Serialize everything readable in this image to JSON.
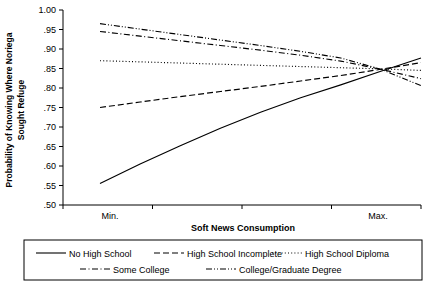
{
  "chart_data": {
    "type": "line",
    "title": "",
    "xlabel": "Soft News Consumption",
    "ylabel": "Probability of Knowing Where Noriega Sought Refuge",
    "ylabel_line1": "Probability of Knowing Where Noriega",
    "ylabel_line2": "Sought Refuge",
    "ylim": [
      0.5,
      1.0
    ],
    "ytick_labels": [
      "1.00",
      ".95",
      ".90",
      ".85",
      ".80",
      ".75",
      ".70",
      ".65",
      ".60",
      ".55",
      ".50"
    ],
    "ytick_values": [
      1.0,
      0.95,
      0.9,
      0.85,
      0.8,
      0.75,
      0.7,
      0.65,
      0.6,
      0.55,
      0.5
    ],
    "xtick_labels": [
      "Min.",
      "Max."
    ],
    "xlim": [
      0,
      1
    ],
    "grid": false,
    "legend_position": "below",
    "x": [
      0.0,
      0.125,
      0.25,
      0.375,
      0.5,
      0.625,
      0.75,
      0.875,
      1.0
    ],
    "series": [
      {
        "name": "No High School",
        "dash": "solid",
        "values": [
          0.555,
          0.605,
          0.652,
          0.697,
          0.738,
          0.775,
          0.808,
          0.843,
          0.877
        ]
      },
      {
        "name": "High School Incomplete",
        "dash": "dashed",
        "values": [
          0.75,
          0.764,
          0.778,
          0.791,
          0.804,
          0.818,
          0.832,
          0.848,
          0.865
        ]
      },
      {
        "name": "High School Diploma",
        "dash": "dotted",
        "values": [
          0.87,
          0.867,
          0.864,
          0.861,
          0.858,
          0.855,
          0.852,
          0.849,
          0.845
        ]
      },
      {
        "name": "Some College",
        "dash": "dashdot",
        "values": [
          0.945,
          0.933,
          0.921,
          0.909,
          0.897,
          0.884,
          0.869,
          0.848,
          0.824
        ]
      },
      {
        "name": "College/Graduate Degree",
        "dash": "dashdotdot",
        "values": [
          0.965,
          0.951,
          0.937,
          0.923,
          0.909,
          0.894,
          0.877,
          0.848,
          0.806
        ]
      }
    ],
    "convergence_point": {
      "x": 0.875,
      "y": 0.85
    }
  },
  "legend": {
    "items": [
      {
        "label": "No High School"
      },
      {
        "label": "High School Incomplete"
      },
      {
        "label": "High School Diploma"
      },
      {
        "label": "Some College"
      },
      {
        "label": "College/Graduate Degree"
      }
    ]
  },
  "colors": {
    "ink": "#000000",
    "background": "#ffffff"
  }
}
